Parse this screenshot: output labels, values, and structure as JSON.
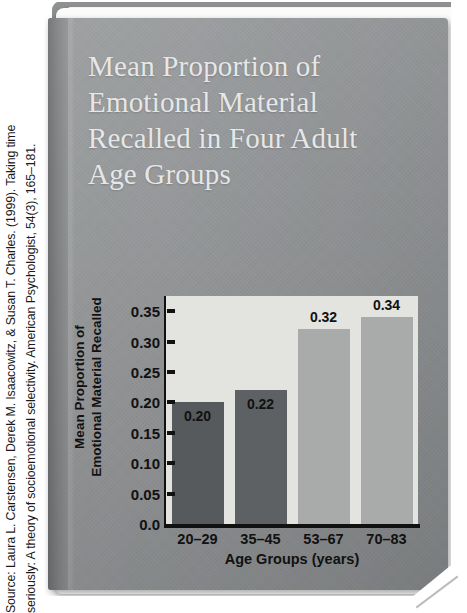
{
  "source_caption": {
    "line1": "Source: Laura L. Carstensen, Derek M. Isaacowitz, & Susan T. Charles. (1999). Taking time",
    "line2": "seriously: A theory of socioemotional selectivity. American Psychologist, 54(3), 165–181."
  },
  "book": {
    "cover_title_lines": [
      "Mean Proportion of",
      "Emotional Material",
      "Recalled in Four Adult",
      "Age Groups"
    ],
    "cover_color": "#939597",
    "page_color": "#fbfbfa"
  },
  "chart_data": {
    "type": "bar",
    "title": "Mean Proportion of Emotional Material Recalled in Four Adult Age Groups",
    "categories": [
      "20–29",
      "35–45",
      "53–67",
      "70–83"
    ],
    "values": [
      0.2,
      0.22,
      0.32,
      0.34
    ],
    "value_labels": [
      "0.20",
      "0.22",
      "0.32",
      "0.34"
    ],
    "bar_colors": [
      "#575a5c",
      "#5e6163",
      "#a9abab",
      "#a9abab"
    ],
    "xlabel": "Age Groups (years)",
    "ylabel_line1": "Mean Proportion of",
    "ylabel_line2": "Emotional Material Recalled",
    "ylim": [
      0.0,
      0.375
    ],
    "ytick_values": [
      0.0,
      0.05,
      0.1,
      0.15,
      0.2,
      0.25,
      0.3,
      0.35
    ],
    "ytick_labels": [
      "0.0",
      "0.05",
      "0.10",
      "0.15",
      "0.20",
      "0.25",
      "0.30",
      "0.35"
    ],
    "grid": false,
    "legend": "none",
    "plot_background": "#e3e3df"
  }
}
